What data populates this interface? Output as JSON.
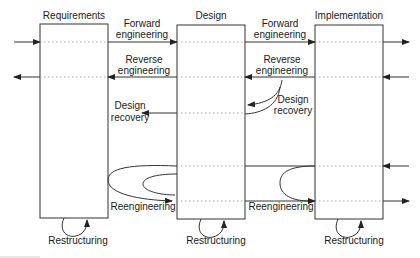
{
  "stages": [
    {
      "id": "requirements",
      "label": "Requirements"
    },
    {
      "id": "design",
      "label": "Design"
    },
    {
      "id": "implementation",
      "label": "Implementation"
    }
  ],
  "transitions": {
    "forward": [
      "Forward",
      "engineering"
    ],
    "reverse": [
      "Reverse",
      "engineering"
    ],
    "design_recovery": [
      "Design",
      "recovery"
    ],
    "reengineering": "Reengineering",
    "restructuring": "Restructuring"
  },
  "colors": {
    "line": "#333333",
    "dotted": "#aaaaaa",
    "text": "#1a1a1a"
  }
}
